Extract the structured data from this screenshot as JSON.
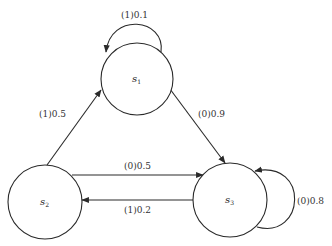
{
  "diagram": {
    "type": "state-transition",
    "nodes": [
      {
        "id": "s1",
        "label": "s",
        "sub": "1",
        "cx": 137,
        "cy": 79,
        "r": 36
      },
      {
        "id": "s2",
        "label": "s",
        "sub": "2",
        "cx": 45,
        "cy": 202,
        "r": 37
      },
      {
        "id": "s3",
        "label": "s",
        "sub": "3",
        "cx": 230,
        "cy": 200,
        "r": 37
      }
    ],
    "edges": [
      {
        "from": "s1",
        "to": "s1",
        "label": "(1)0.1"
      },
      {
        "from": "s1",
        "to": "s3",
        "label": "(0)0.9"
      },
      {
        "from": "s2",
        "to": "s1",
        "label": "(1)0.5"
      },
      {
        "from": "s2",
        "to": "s3",
        "label": "(0)0.5"
      },
      {
        "from": "s3",
        "to": "s2",
        "label": "(1)0.2"
      },
      {
        "from": "s3",
        "to": "s3",
        "label": "(0)0.8"
      }
    ]
  }
}
